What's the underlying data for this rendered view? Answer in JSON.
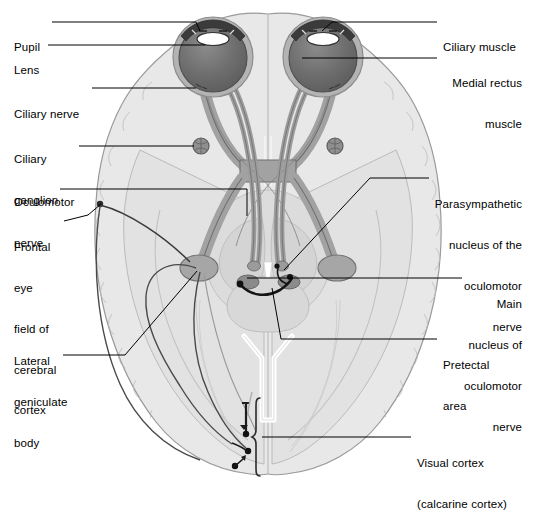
{
  "figure": {
    "type": "anatomical-diagram",
    "palette": {
      "background": "#ffffff",
      "brain_fill": "#e6e6e6",
      "brain_stroke": "#9a9a9a",
      "brain_inner_fill": "#dedede",
      "brainstem_fill": "#d2d2d2",
      "nerve_fill": "#9e9e9e",
      "nerve_stroke": "#6f6f6f",
      "eye_sclera": "#b0b0b0",
      "eye_globe": "#6b6b6b",
      "eye_dark_rim": "#3c3c3c",
      "lens_white": "#ffffff",
      "ganglion_fill": "#8a8a8a",
      "nucleus_dark": "#7a7a7a",
      "leader_line": "#000000",
      "pathway_dark": "#333333",
      "pathway_light": "#8c8c8c",
      "text": "#000000"
    }
  },
  "labels_left": [
    {
      "id": "pupil",
      "name": "Pupil",
      "lines": [
        "Pupil"
      ],
      "x": 14,
      "y": 14,
      "leader": "M 52 22 L 196 22 L 196 30"
    },
    {
      "id": "lens",
      "name": "Lens",
      "lines": [
        "Lens"
      ],
      "x": 14,
      "y": 37,
      "leader": "M 48 45 L 205 45"
    },
    {
      "id": "ciliary-nerve",
      "name": "Ciliary nerve",
      "lines": [
        "Ciliary nerve"
      ],
      "x": 14,
      "y": 81,
      "leader": "M 92 88 L 196 88"
    },
    {
      "id": "ciliary-ganglion",
      "name": "Ciliary ganglion",
      "lines": [
        "Ciliary",
        "ganglion"
      ],
      "x": 14,
      "y": 126,
      "leader": "M 79 146 L 197 146"
    },
    {
      "id": "oculomotor-nerve",
      "name": "Oculomotor nerve",
      "lines": [
        "Oculomotor",
        "nerve"
      ],
      "x": 14,
      "y": 169,
      "leader": "M 60 189 L 247 189 L 247 214"
    },
    {
      "id": "frontal-eye-field",
      "name": "Frontal eye field of cerebral cortex",
      "lines": [
        "Frontal",
        "eye",
        "field of",
        "cerebral",
        "cortex"
      ],
      "x": 14,
      "y": 214,
      "leader": "M 63 221 L 88 215 L 101 205"
    },
    {
      "id": "lateral-geniculate-body",
      "name": "Lateral geniculate body",
      "lines": [
        "Lateral",
        "geniculate",
        "body"
      ],
      "x": 14,
      "y": 328,
      "leader": "M 63 355 L 125 355 L 196 272"
    }
  ],
  "labels_right": [
    {
      "id": "ciliary-muscle",
      "name": "Ciliary muscle",
      "lines": [
        "Ciliary muscle"
      ],
      "x": 443,
      "y": 14,
      "align": "left",
      "leader": "M 437 22 L 332 22 L 318 31"
    },
    {
      "id": "medial-rectus-muscle",
      "name": "Medial rectus muscle",
      "lines": [
        "Medial rectus",
        "muscle"
      ],
      "x": 369,
      "y": 50,
      "align": "right",
      "leader": "M 437 58 L 304 58"
    },
    {
      "id": "parasympathetic-nucleus",
      "name": "Parasympathetic nucleus of the oculomotor nerve",
      "lines": [
        "Parasympathetic",
        "nucleus of the",
        "oculomotor",
        "nerve"
      ],
      "x": 354,
      "y": 171,
      "align": "right",
      "leader": "M 429 178 L 370 178 L 282 271"
    },
    {
      "id": "main-nucleus-oculomotor",
      "name": "Main nucleus of oculomotor nerve",
      "lines": [
        "Main",
        "nucleus of",
        "oculomotor",
        "nerve"
      ],
      "x": 399,
      "y": 271,
      "align": "right",
      "leader": "M 462 278 L 246 278"
    },
    {
      "id": "pretectal-area",
      "name": "Pretectal area",
      "lines": [
        "Pretectal",
        "area"
      ],
      "x": 443,
      "y": 332,
      "align": "left",
      "leader": "M 437 339 L 281 339 L 272 288"
    },
    {
      "id": "visual-cortex",
      "name": "Visual cortex (calcarine cortex)",
      "lines": [
        "Visual cortex",
        "(calcarine cortex)"
      ],
      "x": 417,
      "y": 430,
      "align": "left",
      "leader": "M 411 437 L 263 437"
    }
  ],
  "structures": [
    {
      "id": "left-eye",
      "name": "left-eyeball"
    },
    {
      "id": "right-eye",
      "name": "right-eyeball"
    },
    {
      "id": "optic-chiasm",
      "name": "optic-chiasm"
    },
    {
      "id": "left-ciliary-ganglion",
      "name": "left-ciliary-ganglion"
    },
    {
      "id": "right-ciliary-ganglion",
      "name": "right-ciliary-ganglion"
    },
    {
      "id": "left-lgb",
      "name": "left-lateral-geniculate-body"
    },
    {
      "id": "right-lgb",
      "name": "right-lateral-geniculate-body"
    },
    {
      "id": "brainstem",
      "name": "brainstem-midbrain"
    },
    {
      "id": "visual-cortex-bracket",
      "name": "visual-cortex-bracket"
    }
  ]
}
